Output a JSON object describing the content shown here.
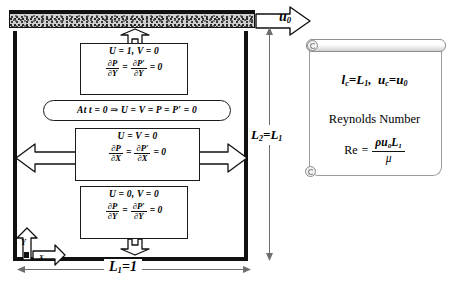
{
  "diagram": {
    "lid": {
      "name": "moving-lid",
      "velocity_label": "u",
      "velocity_sub": "0"
    },
    "cavity": {
      "width_label": "L",
      "width_sub": "1",
      "width_value": "=1",
      "height_label": "L",
      "height_sub": "2",
      "height_value": "=L",
      "height_value_sub": "1"
    },
    "axes": {
      "x_label": "X",
      "y_label": "Y"
    },
    "boundary_conditions": [
      {
        "id": "top-wall",
        "position": "top",
        "line1": "U = 1, V = 0",
        "frac_num_left": "∂P",
        "frac_den_left": "∂Y",
        "equals": "=",
        "frac_num_right": "∂P′",
        "frac_den_right": "∂Y",
        "tail": "= 0"
      },
      {
        "id": "initial-condition",
        "position": "interior",
        "text": "At t = 0 ⇒ U = V = P = P′ = 0"
      },
      {
        "id": "side-walls",
        "position": "left-right",
        "line1": "U = V = 0",
        "frac_num_left": "∂P",
        "frac_den_left": "∂X",
        "equals": "=",
        "frac_num_right": "∂P′",
        "frac_den_right": "∂X",
        "tail": "= 0"
      },
      {
        "id": "bottom-wall",
        "position": "bottom",
        "line1": "U = 0, V = 0",
        "frac_num_left": "∂P",
        "frac_den_left": "∂Y",
        "equals": "=",
        "frac_num_right": "∂P′",
        "frac_den_right": "∂Y",
        "tail": "= 0"
      }
    ],
    "scroll_panel": {
      "characteristic_scales": "lₑ=L₁, uₑ=u₀",
      "scales_plain": "lc=L1, uc=u0",
      "reynolds_title": "Reynolds Number",
      "reynolds_symbol": "Re",
      "reynolds_equals": "=",
      "reynolds_numerator": "ρu₀L₁",
      "reynolds_denominator": "μ"
    },
    "colors": {
      "wall": "#111111",
      "lid_fill": "#cfcfcf",
      "box_stroke": "#1a1a1a",
      "dimension_line": "#6e6e6e",
      "scroll_stroke": "#9a9a9a",
      "background": "#ffffff"
    }
  }
}
